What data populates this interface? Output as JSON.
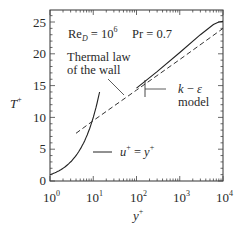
{
  "chart_data": {
    "type": "line",
    "title": "",
    "xlabel": "y+",
    "ylabel": "T+",
    "xscale": "log",
    "xlim": [
      1,
      10000
    ],
    "ylim": [
      0,
      27
    ],
    "x_ticks": [
      "10^0",
      "10^1",
      "10^2",
      "10^3",
      "10^4"
    ],
    "y_ticks": [
      0,
      5,
      10,
      15,
      20,
      25
    ],
    "grid": false,
    "annotations": [
      "Re_D = 10^6",
      "Pr = 0.7",
      "Thermal law of the wall",
      "k − ε model",
      "u+ = y+"
    ],
    "series": [
      {
        "name": "u+ = y+",
        "style": "solid",
        "x": [
          1,
          2,
          4,
          6,
          8,
          10,
          12,
          14
        ],
        "y": [
          1,
          2,
          4,
          6,
          8,
          10,
          12,
          14
        ]
      },
      {
        "name": "Thermal law of the wall",
        "style": "dashed",
        "x": [
          4,
          10,
          100,
          1000,
          10000
        ],
        "y": [
          7.5,
          9.5,
          14.3,
          19.1,
          24.0
        ]
      },
      {
        "name": "k − ε model",
        "style": "solid",
        "x": [
          100,
          300,
          1000,
          3000,
          6000,
          8000,
          10000
        ],
        "y": [
          14.6,
          17.2,
          20.2,
          23.0,
          24.6,
          25.0,
          25.1
        ]
      }
    ]
  },
  "labels": {
    "ylabel_base": "T",
    "ylabel_sup": "+",
    "xlabel_base": "y",
    "xlabel_sup": "+",
    "re_base": "Re",
    "re_sub": "D",
    "re_eq": " = 10",
    "re_exp": "6",
    "pr": "Pr = 0.7",
    "thermal_line1": "Thermal law",
    "thermal_line2": "of the wall",
    "ke_k": "k",
    "ke_dash": " − ",
    "ke_eps": "ε",
    "ke_model": "model",
    "uplus_u": "u",
    "uplus_sup1": "+",
    "uplus_eq": " = ",
    "uplus_y": "y",
    "uplus_sup2": "+"
  },
  "y_tick_labels": [
    "0",
    "5",
    "10",
    "15",
    "20",
    "25"
  ],
  "x_tick_labels": [
    {
      "base": "10",
      "exp": "0"
    },
    {
      "base": "10",
      "exp": "1"
    },
    {
      "base": "10",
      "exp": "2"
    },
    {
      "base": "10",
      "exp": "3"
    },
    {
      "base": "10",
      "exp": "4"
    }
  ]
}
